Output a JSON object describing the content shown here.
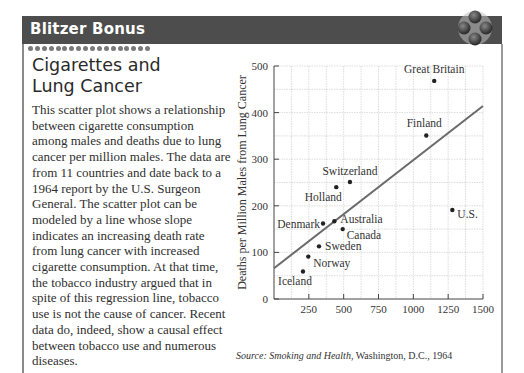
{
  "header": {
    "title": "Blitzer Bonus",
    "logo_icon": "four-petal-ornament-icon",
    "colors": {
      "bar": "#4d4d4d",
      "title": "#ffffff"
    }
  },
  "section": {
    "title_line1": "Cigarettes and",
    "title_line2": "Lung Cancer",
    "body": "This scatter plot shows a relationship between cigarette consumption among males and deaths due to lung cancer per million males. The data are from 11 countries and date back to a 1964 report by the U.S. Surgeon General. The scatter plot can be modeled by a line whose slope indicates an increasing death rate from lung cancer with increased cigarette consumption. At that time, the tobacco industry argued that in spite of this regression line, tobacco use is not the cause of cancer. Recent data do, indeed, show a causal effect between tobacco use and numerous diseases."
  },
  "source": {
    "label": "Source:",
    "title": "Smoking and Health",
    "rest": ", Washington, D.C., 1964"
  },
  "chart_data": {
    "type": "scatter",
    "title": "",
    "xlabel": "Annual Cigarette Consumption for Each Adult Male",
    "xlabel_line1": "Annual Cigarette Consumption",
    "xlabel_line2": "for Each Adult Male",
    "ylabel": "Deaths per Million Males from Lung Cancer",
    "xlim": [
      0,
      1500
    ],
    "ylim": [
      0,
      500
    ],
    "xticks": [
      250,
      500,
      750,
      1000,
      1250,
      1500
    ],
    "yticks": [
      0,
      100,
      200,
      300,
      400,
      500
    ],
    "grid": true,
    "points": [
      {
        "label": "Great Britain",
        "x": 1150,
        "y": 468
      },
      {
        "label": "Finland",
        "x": 1093,
        "y": 351
      },
      {
        "label": "Switzerland",
        "x": 545,
        "y": 251
      },
      {
        "label": "Holland",
        "x": 447,
        "y": 240
      },
      {
        "label": "U.S.",
        "x": 1280,
        "y": 191
      },
      {
        "label": "Denmark",
        "x": 352,
        "y": 162
      },
      {
        "label": "Australia",
        "x": 433,
        "y": 167
      },
      {
        "label": "Canada",
        "x": 493,
        "y": 150
      },
      {
        "label": "Sweden",
        "x": 323,
        "y": 113
      },
      {
        "label": "Norway",
        "x": 246,
        "y": 91
      },
      {
        "label": "Iceland",
        "x": 208,
        "y": 59
      }
    ],
    "regression_line": {
      "x": [
        0,
        1500
      ],
      "y": [
        66,
        414
      ]
    }
  }
}
